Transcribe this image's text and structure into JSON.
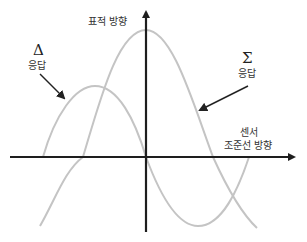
{
  "diagram": {
    "title": "",
    "labels": {
      "target_direction": "표적 방향",
      "delta_symbol": "Δ",
      "delta_response": "응답",
      "sigma_symbol": "Σ",
      "sigma_response": "응답",
      "sensor_line1": "센서",
      "sensor_line2": "조준선 방향"
    },
    "colors": {
      "axes": "#1e1e1e",
      "curves": "#c4c4c4",
      "arrows": "#222222",
      "text": "#333333"
    },
    "axes": {
      "origin": [
        146,
        157
      ],
      "vertical": {
        "from": [
          146,
          232
        ],
        "to": [
          146,
          6
        ]
      },
      "horizontal": {
        "from": [
          10,
          157
        ],
        "to": [
          300,
          157
        ]
      }
    },
    "curves": {
      "sum_pattern": {
        "name": "Σ 응답",
        "peak": [
          146,
          30
        ],
        "zero_crossings": [
          83,
          213
        ],
        "ends": [
          [
            40,
            226
          ],
          [
            257,
            228
          ]
        ]
      },
      "delta_pattern": {
        "name": "Δ 응답",
        "peak": [
          95,
          86
        ],
        "trough": [
          198,
          226
        ],
        "zero_crossings": [
          43,
          146,
          249
        ]
      }
    }
  }
}
